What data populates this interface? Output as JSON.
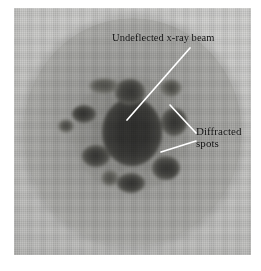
{
  "figure": {
    "name": "x-ray-diffraction-photograph",
    "background_color": "#ffffff",
    "plate_color": "#c9c9c7",
    "film_color": "#a6a6a3",
    "spot_color": "#141414",
    "leader_color": "#ffffff",
    "text_color": "#0e0e0e"
  },
  "annotations": {
    "beam": {
      "label": "Undeflected x-ray beam",
      "leader": {
        "x1": 127,
        "y1": 120,
        "x2": 190,
        "y2": 48
      }
    },
    "spots": {
      "label_line1": "Diffracted",
      "label_line2": "spots",
      "leaders": [
        {
          "x1": 170,
          "y1": 105,
          "x2": 196,
          "y2": 133
        },
        {
          "x1": 161,
          "y1": 152,
          "x2": 196,
          "y2": 141
        }
      ]
    }
  },
  "film": {
    "shape": "circle",
    "center_x": 118,
    "center_y": 124,
    "radius_x": 110,
    "radius_y": 114
  },
  "diffraction_spots": [
    {
      "name": "central-beam",
      "cx": 118,
      "cy": 124,
      "rx": 30,
      "ry": 34,
      "kind": "core"
    },
    {
      "name": "spot-upper-mid",
      "cx": 116,
      "cy": 84,
      "rx": 15,
      "ry": 13,
      "kind": "spot"
    },
    {
      "name": "spot-upper-left",
      "cx": 90,
      "cy": 78,
      "rx": 15,
      "ry": 8,
      "kind": "spot-soft"
    },
    {
      "name": "spot-upper-right",
      "cx": 157,
      "cy": 80,
      "rx": 11,
      "ry": 9,
      "kind": "spot-soft"
    },
    {
      "name": "spot-left",
      "cx": 70,
      "cy": 106,
      "rx": 12,
      "ry": 9,
      "kind": "spot"
    },
    {
      "name": "spot-far-left",
      "cx": 52,
      "cy": 118,
      "rx": 8,
      "ry": 7,
      "kind": "spot-soft"
    },
    {
      "name": "spot-right",
      "cx": 160,
      "cy": 114,
      "rx": 13,
      "ry": 14,
      "kind": "spot"
    },
    {
      "name": "spot-lower-left",
      "cx": 82,
      "cy": 148,
      "rx": 14,
      "ry": 11,
      "kind": "spot"
    },
    {
      "name": "spot-lower-right",
      "cx": 152,
      "cy": 160,
      "rx": 14,
      "ry": 12,
      "kind": "spot"
    },
    {
      "name": "spot-bottom",
      "cx": 117,
      "cy": 175,
      "rx": 14,
      "ry": 10,
      "kind": "spot"
    },
    {
      "name": "spot-bottom-left",
      "cx": 96,
      "cy": 170,
      "rx": 9,
      "ry": 8,
      "kind": "spot-soft"
    },
    {
      "name": "halo-inner",
      "cx": 116,
      "cy": 126,
      "rx": 58,
      "ry": 58,
      "kind": "halo"
    }
  ]
}
